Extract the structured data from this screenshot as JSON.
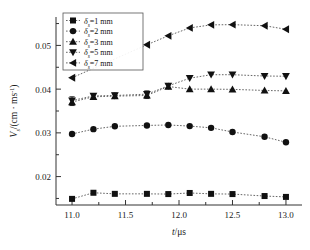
{
  "chart_data": {
    "type": "line",
    "title": "",
    "xlabel": "t/μs",
    "ylabel": "Vₛ/(cm · ms⁻¹)",
    "xlabel_italic_part": "t",
    "xlabel_rest": "/μs",
    "ylabel_italic_part": "V",
    "ylabel_sub": "s",
    "ylabel_rest": "/(cm · ms",
    "ylabel_sup": "-1",
    "ylabel_tail": ")",
    "xlim": [
      10.85,
      13.15
    ],
    "ylim": [
      0.0135,
      0.0565
    ],
    "xticks": [
      11.0,
      11.5,
      12.0,
      12.5,
      13.0
    ],
    "xtick_labels": [
      "11.0",
      "11.5",
      "12.0",
      "12.5",
      "13.0"
    ],
    "xminor_step": 0.25,
    "yticks": [
      0.02,
      0.03,
      0.04,
      0.05
    ],
    "ytick_labels": [
      "0.02",
      "0.03",
      "0.04",
      "0.05"
    ],
    "yminor_step": 0.005,
    "grid": false,
    "legend_position": "upper-left",
    "line_style": "dotted",
    "line_color": "#555555",
    "marker_color": "#111111",
    "series": [
      {
        "name": "δₛ=1 mm",
        "symbol_italic": "δ",
        "symbol_sub": "s",
        "symbol_rest": "=1 mm",
        "marker": "square",
        "x": [
          11.0,
          11.2,
          11.4,
          11.7,
          11.9,
          12.1,
          12.3,
          12.5,
          12.8,
          13.0
        ],
        "values": [
          0.0149,
          0.0163,
          0.01605,
          0.01605,
          0.016,
          0.01625,
          0.01605,
          0.016,
          0.01555,
          0.01535
        ],
        "errors": [
          0,
          0,
          0,
          0,
          0,
          0,
          0,
          0,
          0,
          0
        ]
      },
      {
        "name": "δₛ=2 mm",
        "symbol_italic": "δ",
        "symbol_sub": "s",
        "symbol_rest": "=2 mm",
        "marker": "circle",
        "x": [
          11.0,
          11.2,
          11.4,
          11.7,
          11.9,
          12.1,
          12.3,
          12.5,
          12.8,
          13.0
        ],
        "values": [
          0.02975,
          0.03085,
          0.0315,
          0.0317,
          0.0318,
          0.03155,
          0.03115,
          0.0302,
          0.0291,
          0.02785
        ],
        "errors": [
          0,
          0,
          0,
          0,
          0,
          0,
          0,
          0,
          0,
          0
        ]
      },
      {
        "name": "δₛ=3 mm",
        "symbol_italic": "δ",
        "symbol_sub": "s",
        "symbol_rest": "=3 mm",
        "marker": "triangle-up",
        "x": [
          11.0,
          11.2,
          11.4,
          11.7,
          11.9,
          12.1,
          12.3,
          12.5,
          12.8,
          13.0
        ],
        "values": [
          0.03705,
          0.03825,
          0.0384,
          0.03855,
          0.0406,
          0.04,
          0.04,
          0.03995,
          0.0397,
          0.0396
        ],
        "errors": [
          0.0008,
          0.00045,
          0.00055,
          0.0007,
          0.0005,
          0,
          0,
          0,
          0,
          0
        ]
      },
      {
        "name": "δₛ=5 mm",
        "symbol_italic": "δ",
        "symbol_sub": "s",
        "symbol_rest": "=5 mm",
        "marker": "triangle-down",
        "x": [
          11.0,
          11.2,
          11.4,
          11.7,
          11.9,
          12.1,
          12.3,
          12.5,
          12.8,
          13.0
        ],
        "values": [
          0.0374,
          0.03845,
          0.03855,
          0.03885,
          0.04075,
          0.0425,
          0.0433,
          0.0433,
          0.043,
          0.04295
        ],
        "errors": [
          0.00085,
          0.0005,
          0.00055,
          0.00075,
          0.00055,
          0,
          0,
          0,
          0,
          0
        ]
      },
      {
        "name": "δₛ=7 mm",
        "symbol_italic": "δ",
        "symbol_sub": "s",
        "symbol_rest": "=7 mm",
        "marker": "triangle-left",
        "x": [
          11.0,
          11.7,
          11.9,
          12.1,
          12.3,
          12.5,
          12.8,
          13.0
        ],
        "values": [
          0.0426,
          0.05015,
          0.0522,
          0.054,
          0.0547,
          0.05475,
          0.0545,
          0.0537
        ],
        "errors": [
          0,
          0,
          0,
          0,
          0,
          0,
          0,
          0
        ]
      }
    ]
  }
}
